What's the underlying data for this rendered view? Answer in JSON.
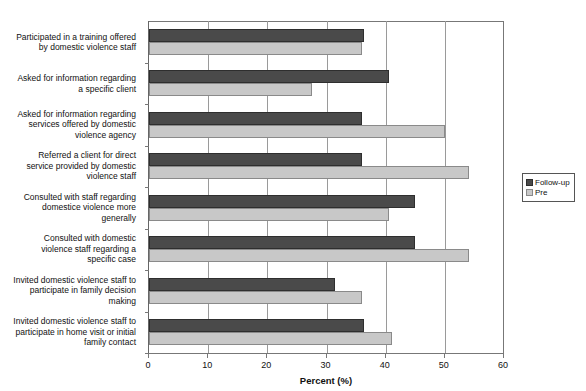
{
  "chart_data": {
    "type": "bar",
    "orientation": "horizontal",
    "title": "",
    "subtitle": "",
    "xlabel": "Percent (%)",
    "ylabel": "",
    "xlim": [
      0,
      60
    ],
    "xticks": [
      0,
      10,
      20,
      30,
      40,
      50,
      60
    ],
    "xtick_labels": [
      "0",
      "10",
      "20",
      "30",
      "40",
      "50",
      "60"
    ],
    "grid": true,
    "grid_axis": "x",
    "legend_position": "right",
    "categories": [
      "Participated in a training offered by domestic violence staff",
      "Asked for information regarding a specific client",
      "Asked for information regarding services offered by domestic violence agency",
      "Referred a client for direct service provided by domestic violence staff",
      "Consulted with staff regarding domestice violence more generally",
      "Consulted with domestic violence staff regarding a specific case",
      "Invited domestic violence staff to participate in family decision making",
      "Invited domestic violence staff to participate in home visit or initial family contact"
    ],
    "category_lines": [
      [
        "Participated in a training offered",
        "by domestic violence staff"
      ],
      [
        "Asked for information regarding",
        "a specific client"
      ],
      [
        "Asked for information regarding",
        "services offered by domestic",
        "violence agency"
      ],
      [
        "Referred a client for direct",
        "service provided by domestic",
        "violence staff"
      ],
      [
        "Consulted with staff regarding",
        "domestice violence more",
        "generally"
      ],
      [
        "Consulted with domestic",
        "violence staff regarding a",
        "specific case"
      ],
      [
        "Invited domestic violence staff to",
        "participate in family decision",
        "making"
      ],
      [
        "Invited domestic violence staff to",
        "participate in home visit or initial",
        "family contact"
      ]
    ],
    "series": [
      {
        "name": "Follow-up",
        "color": "#4a4a4a",
        "values": [
          36.3,
          40.5,
          36.0,
          36.0,
          45.0,
          45.0,
          31.5,
          36.3
        ]
      },
      {
        "name": "Pre",
        "color": "#c8c8c8",
        "values": [
          36.0,
          27.5,
          50.0,
          54.0,
          40.5,
          54.0,
          36.0,
          41.0
        ]
      }
    ]
  },
  "legend": {
    "items": [
      {
        "label": "Follow-up",
        "swatch": "followup"
      },
      {
        "label": "Pre",
        "swatch": "pre"
      }
    ]
  },
  "axis": {
    "x_title": "Percent (%)"
  }
}
